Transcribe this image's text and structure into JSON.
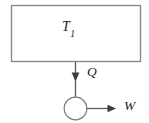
{
  "diagram": {
    "type": "thermodynamic-heat-engine-schematic",
    "background_color": "#ffffff",
    "line_color": "#6e6e6e",
    "text_color": "#1c1c1c",
    "reservoir": {
      "label": "T",
      "subscript": "1",
      "shape": "rectangle",
      "x": 11,
      "y": 5,
      "width": 130,
      "height": 57
    },
    "engine": {
      "shape": "circle",
      "center_x": 75.5,
      "center_y": 108.5,
      "radius": 11.5
    },
    "heat_arrow": {
      "label": "Q",
      "direction": "down",
      "from_x": 75.5,
      "from_y": 62,
      "to_x": 75.5,
      "to_y": 97
    },
    "work_arrow": {
      "label": "W",
      "direction": "right",
      "from_x": 87,
      "from_y": 108.5,
      "to_x": 115,
      "to_y": 108.5
    }
  }
}
